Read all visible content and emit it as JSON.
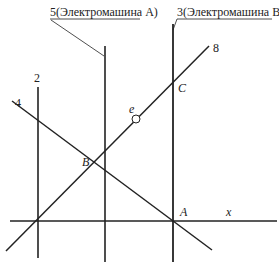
{
  "diagram": {
    "labels": {
      "machine_a": "5(Электромашина A)",
      "machine_b": "3(Электромашина B)",
      "line_2": "2",
      "line_4": "4",
      "line_8": "8",
      "point_e": "e",
      "point_b": "B",
      "point_c": "C",
      "point_a": "A",
      "axis_x": "x"
    },
    "colors": {
      "stroke": "#222222",
      "background": "#ffffff"
    }
  }
}
